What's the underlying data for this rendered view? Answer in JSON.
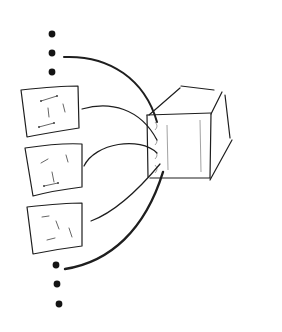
{
  "diagram": {
    "title": "",
    "style": "hand-drawn sketch",
    "ink_color": "#1e1e1e",
    "background": "#ffffff",
    "nodes": [
      {
        "id": "ellipsis-top",
        "kind": "ellipsis",
        "dots": 3
      },
      {
        "id": "card-1",
        "kind": "card"
      },
      {
        "id": "card-2",
        "kind": "card"
      },
      {
        "id": "card-3",
        "kind": "card"
      },
      {
        "id": "ellipsis-bottom",
        "kind": "ellipsis",
        "dots": 3
      },
      {
        "id": "box",
        "kind": "3d-box",
        "ports": 4
      }
    ],
    "edges": [
      {
        "from": "ellipsis-top",
        "to": "box",
        "port": 1
      },
      {
        "from": "card-1",
        "to": "box",
        "port": 2
      },
      {
        "from": "card-2",
        "to": "box",
        "port": 3
      },
      {
        "from": "card-3",
        "to": "box",
        "port": 4
      },
      {
        "from": "ellipsis-bottom",
        "to": "box",
        "port": 4
      }
    ]
  }
}
